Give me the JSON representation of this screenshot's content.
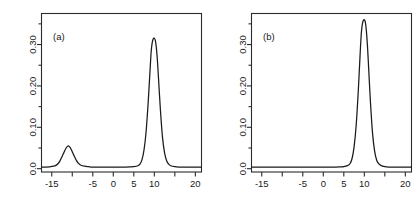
{
  "figure": {
    "background": "#ffffff",
    "line_color": "#1a1a1a",
    "axis_color": "#2b2b2b"
  },
  "chart_data": [
    {
      "type": "line",
      "title": "",
      "subtitle": "",
      "panel_label": "(a)",
      "xlabel": "",
      "ylabel": "",
      "xlim": [
        -17.5,
        21.5
      ],
      "ylim": [
        -0.008,
        0.375
      ],
      "grid": false,
      "legend": "none",
      "x_major_ticks": [
        -15,
        -5,
        0,
        5,
        10,
        20
      ],
      "x_major_tick_labels": [
        "-15",
        "-5",
        "0",
        "5",
        "10",
        "20"
      ],
      "x_minor_ticks": [
        -10,
        15
      ],
      "y_major_ticks": [
        0.0,
        0.1,
        0.2,
        0.3
      ],
      "y_major_tick_labels": [
        "0.0",
        "0.10",
        "0.20",
        "0.30"
      ],
      "y_minor_ticks": [
        0.05,
        0.15,
        0.25,
        0.35
      ],
      "series": [
        {
          "name": "density-a",
          "description": "bimodal mixture density: minor mode near -11, dominant mode near 10",
          "modes": [
            {
              "center": -11.0,
              "peak_height": 0.055,
              "sd": 1.5,
              "weight": 0.21
            },
            {
              "center": 10.0,
              "peak_height": 0.315,
              "sd": 1.05,
              "weight": 0.79
            }
          ],
          "baseline": 0.004,
          "x": [
            -17.5,
            -16.5,
            -15.5,
            -14.5,
            -14.0,
            -13.5,
            -13.0,
            -12.5,
            -12.0,
            -11.5,
            -11.0,
            -10.5,
            -10.0,
            -9.5,
            -9.0,
            -8.5,
            -8.0,
            -7.0,
            -6.0,
            -5.0,
            -3.0,
            -1.0,
            1.0,
            3.0,
            5.0,
            6.0,
            6.5,
            7.0,
            7.5,
            8.0,
            8.5,
            9.0,
            9.25,
            9.5,
            9.75,
            10.0,
            10.25,
            10.5,
            10.75,
            11.0,
            11.5,
            12.0,
            12.5,
            13.0,
            13.5,
            14.0,
            15.0,
            16.0,
            17.5,
            19.0,
            21.5
          ],
          "y": [
            0.004,
            0.004,
            0.0045,
            0.006,
            0.008,
            0.012,
            0.019,
            0.029,
            0.04,
            0.05,
            0.055,
            0.051,
            0.041,
            0.03,
            0.02,
            0.013,
            0.009,
            0.006,
            0.0048,
            0.004,
            0.004,
            0.004,
            0.004,
            0.004,
            0.005,
            0.007,
            0.011,
            0.022,
            0.046,
            0.09,
            0.16,
            0.245,
            0.285,
            0.305,
            0.314,
            0.315,
            0.31,
            0.292,
            0.262,
            0.222,
            0.14,
            0.075,
            0.038,
            0.019,
            0.011,
            0.007,
            0.0048,
            0.004,
            0.004,
            0.004,
            0.004
          ]
        }
      ]
    },
    {
      "type": "line",
      "title": "",
      "subtitle": "",
      "panel_label": "(b)",
      "xlabel": "",
      "ylabel": "",
      "xlim": [
        -17.5,
        21.5
      ],
      "ylim": [
        -0.008,
        0.375
      ],
      "grid": false,
      "legend": "none",
      "x_major_ticks": [
        -15,
        -5,
        0,
        5,
        10,
        20
      ],
      "x_major_tick_labels": [
        "-15",
        "-5",
        "0",
        "5",
        "10",
        "20"
      ],
      "x_minor_ticks": [
        -10,
        15
      ],
      "y_major_ticks": [
        0.0,
        0.1,
        0.2,
        0.3
      ],
      "y_major_tick_labels": [
        "0.0",
        "0.10",
        "0.20",
        "0.30"
      ],
      "y_minor_ticks": [
        0.05,
        0.15,
        0.25,
        0.35
      ],
      "series": [
        {
          "name": "density-b",
          "description": "unimodal density: single dominant mode near 10, flat elsewhere",
          "modes": [
            {
              "center": 10.0,
              "peak_height": 0.36,
              "sd": 1.0,
              "weight": 1.0
            }
          ],
          "baseline": 0.004,
          "x": [
            -17.5,
            -15.0,
            -12.0,
            -10.0,
            -8.0,
            -5.0,
            -2.0,
            0.0,
            2.0,
            4.0,
            5.0,
            6.0,
            6.5,
            7.0,
            7.5,
            8.0,
            8.5,
            9.0,
            9.25,
            9.5,
            9.75,
            10.0,
            10.25,
            10.5,
            10.75,
            11.0,
            11.5,
            12.0,
            12.5,
            13.0,
            13.5,
            14.0,
            15.0,
            16.0,
            17.5,
            19.0,
            21.5
          ],
          "y": [
            0.004,
            0.004,
            0.004,
            0.004,
            0.004,
            0.004,
            0.004,
            0.004,
            0.004,
            0.0045,
            0.005,
            0.008,
            0.012,
            0.024,
            0.052,
            0.103,
            0.183,
            0.281,
            0.325,
            0.348,
            0.358,
            0.36,
            0.354,
            0.333,
            0.299,
            0.254,
            0.16,
            0.086,
            0.043,
            0.021,
            0.012,
            0.008,
            0.005,
            0.004,
            0.004,
            0.004,
            0.004
          ]
        }
      ]
    }
  ]
}
